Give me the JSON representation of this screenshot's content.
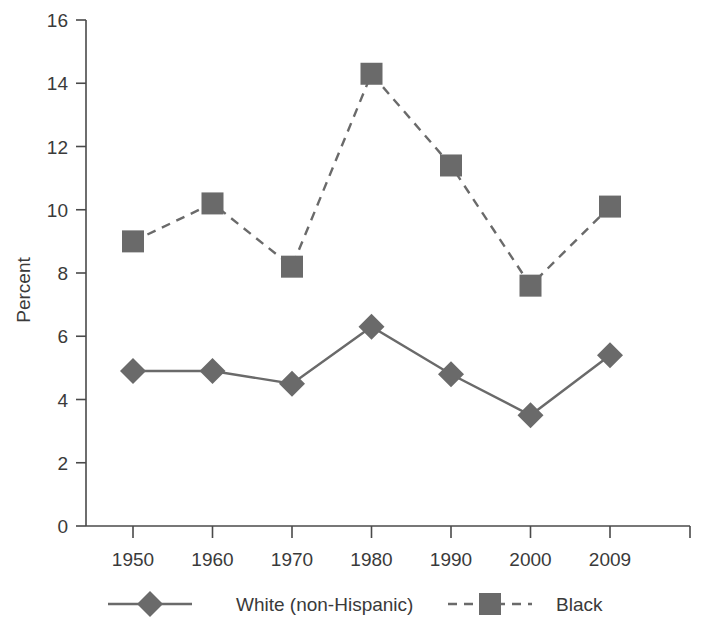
{
  "chart_data": {
    "type": "line",
    "title": "",
    "xlabel": "",
    "ylabel": "Percent",
    "categories": [
      "1950",
      "1960",
      "1970",
      "1980",
      "1990",
      "2000",
      "2009"
    ],
    "x_tick_labels": [
      "1950",
      "1960",
      "1970",
      "1980",
      "1990",
      "2000",
      "2009"
    ],
    "y_tick_labels": [
      "0",
      "2",
      "4",
      "6",
      "8",
      "10",
      "12",
      "14",
      "16"
    ],
    "ylim": [
      0,
      16
    ],
    "y_tick_step": 2,
    "grid": false,
    "legend_position": "bottom",
    "series": [
      {
        "name": "White (non-Hispanic)",
        "marker": "diamond",
        "line_style": "solid",
        "color": "#6a6a6a",
        "values": [
          4.9,
          4.9,
          4.5,
          6.3,
          4.8,
          3.5,
          5.4
        ]
      },
      {
        "name": "Black",
        "marker": "square",
        "line_style": "dashed",
        "color": "#6a6a6a",
        "values": [
          9.0,
          10.2,
          8.2,
          14.3,
          11.4,
          7.6,
          10.1
        ]
      }
    ]
  },
  "legend": {
    "items": [
      {
        "label": "White (non-Hispanic)",
        "marker": "diamond",
        "line_style": "solid"
      },
      {
        "label": "Black",
        "marker": "square",
        "line_style": "dashed"
      }
    ]
  },
  "colors": {
    "series": "#6a6a6a",
    "axis": "#4a4a4a",
    "text": "#3a3a3a",
    "background": "#ffffff"
  }
}
